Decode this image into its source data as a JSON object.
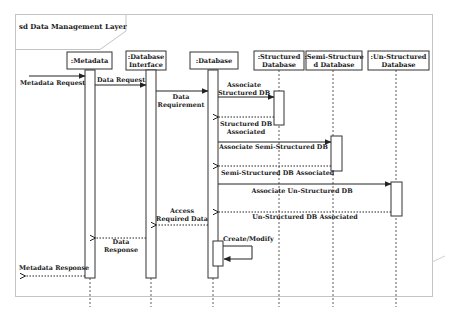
{
  "diagram": {
    "type": "sequence",
    "frame_title": "sd Data Management Layer",
    "lifelines": [
      {
        "id": "metadata",
        "line1": ":Metadata",
        "line2": ""
      },
      {
        "id": "db_interface",
        "line1": ":Database",
        "line2": "Interface"
      },
      {
        "id": "database",
        "line1": ":Database",
        "line2": ""
      },
      {
        "id": "structured",
        "line1": ":Structured",
        "line2": "Database"
      },
      {
        "id": "semi_structured",
        "line1": ":Semi-Structure",
        "line2": "d Database"
      },
      {
        "id": "un_structured",
        "line1": ":Un-Structured",
        "line2": "Database"
      }
    ],
    "messages": [
      {
        "from": "external",
        "to": "metadata",
        "kind": "sync",
        "line1": "Metadata Request",
        "line2": ""
      },
      {
        "from": "metadata",
        "to": "db_interface",
        "kind": "sync",
        "line1": "Data Request",
        "line2": ""
      },
      {
        "from": "db_interface",
        "to": "database",
        "kind": "sync",
        "line1": "Data",
        "line2": "Requirement"
      },
      {
        "from": "database",
        "to": "structured",
        "kind": "sync",
        "line1": "Associate",
        "line2": "Structured DB"
      },
      {
        "from": "structured",
        "to": "database",
        "kind": "return",
        "line1": "Structured DB",
        "line2": "Associated"
      },
      {
        "from": "database",
        "to": "semi_structured",
        "kind": "sync",
        "line1": "Associate  Semi-Structured DB",
        "line2": ""
      },
      {
        "from": "semi_structured",
        "to": "database",
        "kind": "return",
        "line1": "Semi-Structured DB Associated",
        "line2": ""
      },
      {
        "from": "database",
        "to": "un_structured",
        "kind": "sync",
        "line1": "Associate  Un-Structured DB",
        "line2": ""
      },
      {
        "from": "un_structured",
        "to": "database",
        "kind": "return",
        "line1": "Un-Structured DB Associated",
        "line2": ""
      },
      {
        "from": "database",
        "to": "db_interface",
        "kind": "return",
        "line1": "Access",
        "line2": "Required Data"
      },
      {
        "from": "database",
        "to": "database",
        "kind": "self",
        "line1": "Create/Modify",
        "line2": ""
      },
      {
        "from": "db_interface",
        "to": "metadata",
        "kind": "return",
        "line1": "Data",
        "line2": "Response"
      },
      {
        "from": "metadata",
        "to": "external",
        "kind": "return",
        "line1": "Metadata Response",
        "line2": ""
      }
    ],
    "colors": {
      "line": "#2a2a2a",
      "frame": "#bdbdbd",
      "background": "#ffffff"
    }
  }
}
